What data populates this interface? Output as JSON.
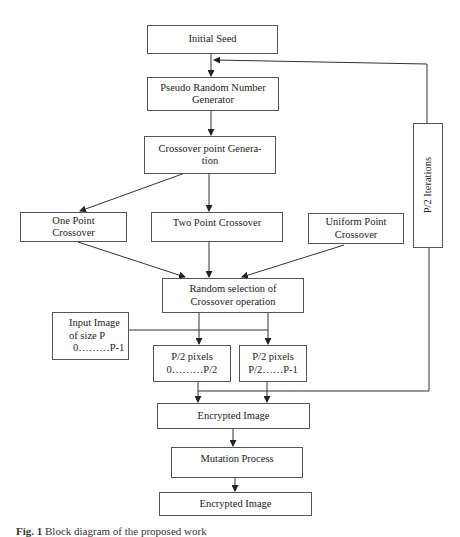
{
  "diagram": {
    "nodes": {
      "initial_seed": {
        "lines": [
          "Initial Seed"
        ]
      },
      "prng": {
        "lines": [
          "Pseudo Random Number",
          "Generator"
        ]
      },
      "crossover_point_generation": {
        "lines": [
          "Crossover point Genera-",
          "tion"
        ]
      },
      "one_point": {
        "lines": [
          "One Point",
          "Crossover"
        ]
      },
      "two_point": {
        "lines": [
          "Two Point Crossover"
        ]
      },
      "uniform_point": {
        "lines": [
          "Uniform Point",
          "Crossover"
        ]
      },
      "iterations": {
        "lines": [
          "P/2 Iterations"
        ]
      },
      "random_selection": {
        "lines": [
          "Random selection of",
          "Crossover operation"
        ]
      },
      "input_image": {
        "lines": [
          "Input Image",
          "of size P",
          "0………P-1"
        ]
      },
      "half_left": {
        "lines": [
          "P/2 pixels",
          "0………P/2"
        ]
      },
      "half_right": {
        "lines": [
          "P/2 pixels",
          "P/2……P-1"
        ]
      },
      "encrypted_image_1": {
        "lines": [
          "Encrypted Image"
        ]
      },
      "mutation": {
        "lines": [
          "Mutation Process"
        ]
      },
      "encrypted_image_2": {
        "lines": [
          "Encrypted Image"
        ]
      }
    },
    "edges": [
      [
        "initial_seed",
        "prng"
      ],
      [
        "prng",
        "crossover_point_generation"
      ],
      [
        "crossover_point_generation",
        "one_point"
      ],
      [
        "crossover_point_generation",
        "two_point"
      ],
      [
        "one_point",
        "random_selection"
      ],
      [
        "two_point",
        "random_selection"
      ],
      [
        "uniform_point",
        "random_selection"
      ],
      [
        "random_selection",
        "half_left"
      ],
      [
        "random_selection",
        "half_right"
      ],
      [
        "input_image",
        "half_right"
      ],
      [
        "half_left",
        "encrypted_image_1"
      ],
      [
        "half_right",
        "encrypted_image_1"
      ],
      [
        "encrypted_image_1",
        "iterations"
      ],
      [
        "iterations",
        "prng"
      ],
      [
        "encrypted_image_1",
        "mutation"
      ],
      [
        "mutation",
        "encrypted_image_2"
      ]
    ],
    "caption": {
      "label": "Fig. 1",
      "text": "Block diagram of the proposed work"
    }
  }
}
